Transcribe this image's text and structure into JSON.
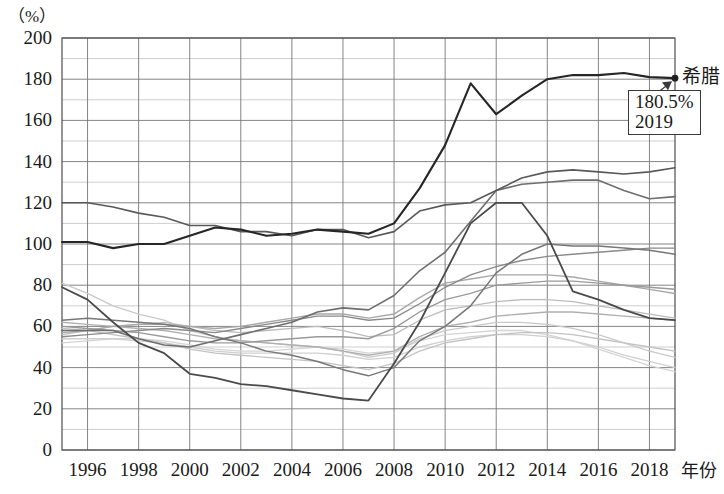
{
  "unit_label": "（%）",
  "x_axis_title": "年份",
  "callout": {
    "value_text": "180.5%",
    "year_text": "2019"
  },
  "series_label_greece": "希腊",
  "axis": {
    "y_ticks": [
      "0",
      "20",
      "40",
      "60",
      "80",
      "100",
      "120",
      "140",
      "160",
      "180",
      "200"
    ],
    "x_ticks": [
      "1996",
      "1998",
      "2000",
      "2002",
      "2004",
      "2006",
      "2008",
      "2010",
      "2012",
      "2014",
      "2016",
      "2018"
    ]
  },
  "chart_data": {
    "type": "line",
    "title": "",
    "subtitle": "",
    "xlabel": "年份",
    "ylabel": "（%）",
    "xlim": [
      1995,
      2019
    ],
    "ylim": [
      0,
      200
    ],
    "grid": true,
    "grid_major_y": 20,
    "grid_minor_y": 10,
    "grid_major_x": 1,
    "legend_position": "inline-right",
    "annotations": [
      {
        "text": "180.5%\n2019",
        "series": "希腊",
        "x": 2019,
        "y": 180.5,
        "marker": "dot",
        "leader": true
      },
      {
        "text": "希腊",
        "x": 2019,
        "y": 180.5,
        "type": "series-label"
      }
    ],
    "x": [
      1995,
      1996,
      1997,
      1998,
      1999,
      2000,
      2001,
      2002,
      2003,
      2004,
      2005,
      2006,
      2007,
      2008,
      2009,
      2010,
      2011,
      2012,
      2013,
      2014,
      2015,
      2016,
      2017,
      2018,
      2019
    ],
    "series": [
      {
        "name": "希腊",
        "color": "#262626",
        "width": 2.1,
        "values": [
          101,
          101,
          98,
          100,
          100,
          104,
          108,
          107,
          104,
          105,
          107,
          106,
          105,
          110,
          127,
          148,
          178,
          163,
          172,
          180,
          182,
          182,
          183,
          181,
          180.5
        ]
      },
      {
        "name": "series-2",
        "color": "#595959",
        "width": 1.6,
        "values": [
          120,
          120,
          118,
          115,
          113,
          109,
          109,
          106,
          106,
          104,
          107,
          107,
          103,
          106,
          116,
          119,
          120,
          126,
          132,
          135,
          136,
          135,
          134,
          135,
          137
        ]
      },
      {
        "name": "series-3",
        "color": "#6e6e6e",
        "width": 1.6,
        "values": [
          58,
          58,
          58,
          54,
          51,
          50,
          53,
          56,
          59,
          62,
          67,
          69,
          68,
          75,
          87,
          96,
          111,
          126,
          129,
          130,
          131,
          131,
          126,
          122,
          123
        ]
      },
      {
        "name": "series-4",
        "color": "#4a4a4a",
        "width": 1.8,
        "values": [
          79,
          73,
          62,
          52,
          47,
          37,
          35,
          32,
          31,
          29,
          27,
          25,
          24,
          42,
          62,
          86,
          110,
          120,
          120,
          104,
          77,
          73,
          68,
          64,
          63
        ]
      },
      {
        "name": "series-5",
        "color": "#777777",
        "width": 1.5,
        "values": [
          63,
          64,
          63,
          62,
          61,
          59,
          55,
          52,
          48,
          46,
          43,
          39,
          36,
          40,
          53,
          60,
          70,
          86,
          95,
          100,
          99,
          99,
          98,
          97,
          95
        ]
      },
      {
        "name": "series-6",
        "color": "#8a8a8a",
        "width": 1.4,
        "values": [
          55,
          56,
          57,
          58,
          59,
          58,
          57,
          59,
          61,
          63,
          65,
          65,
          63,
          64,
          71,
          79,
          85,
          89,
          92,
          94,
          95,
          96,
          97,
          98,
          98
        ]
      },
      {
        "name": "series-7",
        "color": "#9a9a9a",
        "width": 1.4,
        "values": [
          60,
          59,
          58,
          57,
          55,
          53,
          52,
          52,
          53,
          54,
          55,
          55,
          54,
          59,
          67,
          73,
          76,
          80,
          81,
          82,
          82,
          81,
          80,
          79,
          78
        ]
      },
      {
        "name": "series-8",
        "color": "#a8a8a8",
        "width": 1.4,
        "values": [
          57,
          58,
          60,
          61,
          61,
          60,
          59,
          60,
          62,
          64,
          66,
          66,
          64,
          66,
          74,
          81,
          83,
          85,
          85,
          85,
          84,
          82,
          80,
          78,
          76
        ]
      },
      {
        "name": "series-9",
        "color": "#b0b0b0",
        "width": 1.4,
        "values": [
          62,
          61,
          60,
          59,
          58,
          56,
          54,
          53,
          52,
          51,
          50,
          48,
          46,
          48,
          55,
          60,
          62,
          65,
          66,
          67,
          67,
          66,
          65,
          64,
          63
        ]
      },
      {
        "name": "series-10",
        "color": "#bcbcbc",
        "width": 1.3,
        "values": [
          56,
          58,
          60,
          61,
          62,
          60,
          58,
          57,
          58,
          59,
          60,
          58,
          55,
          56,
          63,
          68,
          70,
          72,
          73,
          73,
          72,
          70,
          68,
          66,
          64
        ]
      },
      {
        "name": "series-11",
        "color": "#c2c2c2",
        "width": 1.3,
        "values": [
          59,
          58,
          56,
          54,
          52,
          49,
          47,
          46,
          45,
          44,
          43,
          41,
          39,
          42,
          48,
          52,
          54,
          56,
          57,
          57,
          56,
          54,
          52,
          50,
          48
        ]
      },
      {
        "name": "series-12",
        "color": "#c9c9c9",
        "width": 1.3,
        "values": [
          81,
          76,
          70,
          66,
          63,
          58,
          55,
          53,
          52,
          51,
          50,
          48,
          45,
          47,
          54,
          58,
          60,
          62,
          62,
          61,
          59,
          56,
          52,
          48,
          45
        ]
      },
      {
        "name": "series-13",
        "color": "#cfcfcf",
        "width": 1.3,
        "values": [
          54,
          54,
          54,
          53,
          52,
          50,
          48,
          47,
          47,
          47,
          47,
          46,
          44,
          45,
          50,
          53,
          55,
          56,
          56,
          55,
          53,
          50,
          46,
          43,
          40
        ]
      },
      {
        "name": "series-14",
        "color": "#d4d4d4",
        "width": 1.3,
        "values": [
          52,
          53,
          54,
          54,
          53,
          51,
          49,
          48,
          48,
          49,
          50,
          49,
          47,
          48,
          53,
          56,
          57,
          58,
          58,
          56,
          53,
          49,
          45,
          41,
          38
        ]
      }
    ]
  }
}
